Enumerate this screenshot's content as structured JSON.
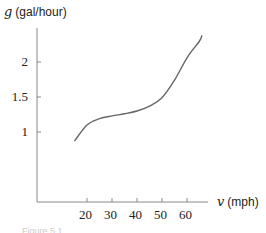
{
  "chart_data": {
    "type": "line",
    "title": "",
    "xlabel": "v (mph)",
    "ylabel": "g (gal/hour)",
    "x_var": "v",
    "x_unit": "(mph)",
    "y_var": "g",
    "y_unit": "(gal/hour)",
    "xlim": [
      0,
      68
    ],
    "ylim": [
      0,
      2.45
    ],
    "x_ticks": [
      20,
      30,
      40,
      50,
      60
    ],
    "y_ticks": [
      1,
      1.5,
      2
    ],
    "x_tick_labels": [
      "20",
      "30",
      "40",
      "50",
      "60"
    ],
    "y_tick_labels": [
      "1",
      "1.5",
      "2"
    ],
    "grid": false,
    "series": [
      {
        "name": "g(v)",
        "x": [
          15,
          20,
          25,
          30,
          35,
          40,
          45,
          50,
          55,
          60,
          65,
          66
        ],
        "values": [
          0.87,
          1.1,
          1.19,
          1.23,
          1.26,
          1.3,
          1.37,
          1.49,
          1.74,
          2.06,
          2.3,
          2.38
        ]
      }
    ]
  },
  "caption": "Figure 5.1"
}
